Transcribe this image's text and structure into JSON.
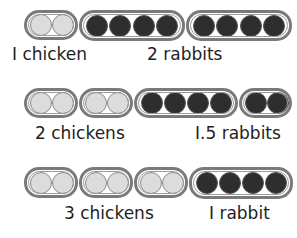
{
  "rows": [
    {
      "groups": [
        {
          "type": "chicken",
          "count": 2
        },
        {
          "type": "rabbit",
          "count": 4
        },
        {
          "type": "rabbit",
          "count": 4
        }
      ],
      "labels": {
        "chicken": "I chicken",
        "rabbit": "2 rabbits"
      }
    },
    {
      "groups": [
        {
          "type": "chicken",
          "count": 2
        },
        {
          "type": "chicken",
          "count": 2
        },
        {
          "type": "rabbit",
          "count": 4
        },
        {
          "type": "rabbit",
          "count": 2
        }
      ],
      "labels": {
        "chicken": "2 chickens",
        "rabbit": "I.5 rabbits"
      }
    },
    {
      "groups": [
        {
          "type": "chicken",
          "count": 2
        },
        {
          "type": "chicken",
          "count": 2
        },
        {
          "type": "chicken",
          "count": 2
        },
        {
          "type": "rabbit",
          "count": 4
        }
      ],
      "labels": {
        "chicken": "3 chickens",
        "rabbit": "I rabbit"
      }
    }
  ],
  "colors": {
    "chicken_dot": "#dcdcdc",
    "rabbit_dot": "#2e2e2e",
    "outline": "#7a7a7a"
  }
}
